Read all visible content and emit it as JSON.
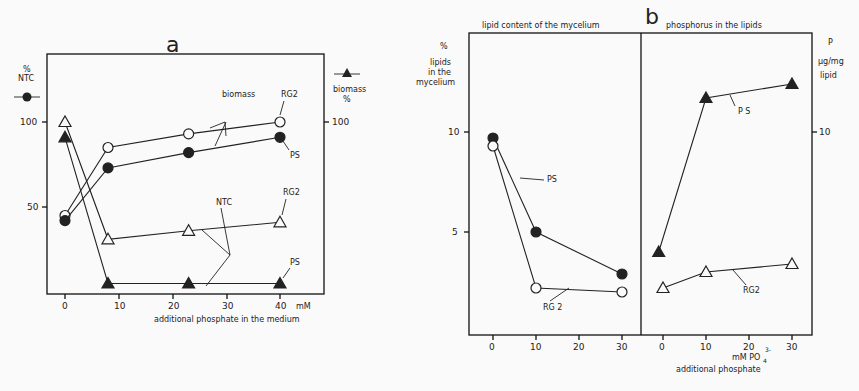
{
  "figure": {
    "panel_a_label": "a",
    "panel_b_label": "b"
  },
  "chart_data": [
    {
      "type": "line",
      "panel": "a",
      "title": "a",
      "xlabel": "additional phosphate in the medium",
      "x_unit": "mM",
      "ylabel_left": "% NTC",
      "ylabel_left_marker": "-●-",
      "ylabel_right": "biomass %",
      "ylabel_right_marker": "-▲-",
      "x_ticks": [
        0,
        10,
        20,
        30,
        40
      ],
      "y_ticks_left": [
        50,
        100
      ],
      "y_ticks_right": [
        100
      ],
      "xlim": [
        -2,
        46
      ],
      "ylim": [
        0,
        125
      ],
      "grid": false,
      "annotations": [
        "biomass",
        "NTC",
        "RG2",
        "PS",
        "RG2",
        "PS"
      ],
      "series": [
        {
          "name": "RG2 NTC",
          "marker": "open-circle",
          "x": [
            0,
            8,
            23,
            40
          ],
          "y": [
            45,
            85,
            93,
            100
          ]
        },
        {
          "name": "PS NTC",
          "marker": "filled-circle",
          "x": [
            0,
            8,
            23,
            40
          ],
          "y": [
            42,
            73,
            82,
            91
          ]
        },
        {
          "name": "RG2 biomass",
          "marker": "open-triangle",
          "x": [
            0,
            8,
            23,
            40
          ],
          "y": [
            100,
            31,
            36,
            41
          ]
        },
        {
          "name": "PS biomass",
          "marker": "filled-triangle",
          "x": [
            0,
            8,
            23,
            40
          ],
          "y": [
            91,
            5,
            5,
            5
          ]
        }
      ]
    },
    {
      "type": "line",
      "panel": "b-left",
      "title": "lipid content of the mycelium",
      "xlabel": "",
      "ylabel": "% lipids in the mycelium",
      "x_ticks": [
        0,
        10,
        20,
        30
      ],
      "y_ticks": [
        5,
        10
      ],
      "xlim": [
        -5,
        35
      ],
      "ylim": [
        0,
        15
      ],
      "grid": false,
      "series": [
        {
          "name": "PS",
          "marker": "filled-circle",
          "x": [
            0,
            10,
            30
          ],
          "y": [
            9.7,
            5.0,
            2.9
          ]
        },
        {
          "name": "RG 2",
          "marker": "open-circle",
          "x": [
            0,
            10,
            30
          ],
          "y": [
            9.3,
            2.2,
            2.0
          ]
        }
      ]
    },
    {
      "type": "line",
      "panel": "b-right",
      "title": "phosphorus in the lipids",
      "xlabel": "mM PO4 3- additional phosphate",
      "ylabel": "P µg/mg lipid",
      "x_ticks": [
        0,
        10,
        20,
        30
      ],
      "y_ticks": [
        10
      ],
      "xlim": [
        -5,
        35
      ],
      "ylim": [
        0,
        15
      ],
      "grid": false,
      "series": [
        {
          "name": "PS",
          "marker": "filled-triangle",
          "x": [
            -1,
            10,
            30
          ],
          "y": [
            4.0,
            11.7,
            12.4
          ]
        },
        {
          "name": "RG2",
          "marker": "open-triangle",
          "x": [
            0,
            10,
            30
          ],
          "y": [
            2.2,
            3.0,
            3.4
          ]
        }
      ]
    }
  ],
  "labels": {
    "a_left_unit": "%",
    "a_left_name": "NTC",
    "a_right_name": "biomass",
    "a_right_unit": "%",
    "a_x_unit": "mM",
    "a_xlabel": "additional phosphate in the medium",
    "a_biomass": "biomass",
    "a_ntc": "NTC",
    "a_rg2_top": "RG2",
    "a_ps_top": "PS",
    "a_rg2_mid": "RG2",
    "a_ps_bot": "PS",
    "a_tick_100": "100",
    "a_tick_50": "50",
    "a_rtick_100": "100",
    "a_xticks": [
      "0",
      "10",
      "20",
      "30",
      "40"
    ],
    "b_left_title": "lipid content of the mycelium",
    "b_right_title": "phosphorus in the lipids",
    "b_left_unit": "%",
    "b_left_y1": "lipids",
    "b_left_y2": "in the",
    "b_left_y3": "mycelium",
    "b_right_y1": "P",
    "b_right_y2": "µg/mg",
    "b_right_y3": "lipid",
    "b_tick_10": "10",
    "b_tick_5": "5",
    "b_rtick_10": "10",
    "b_xticks": [
      "0",
      "10",
      "20",
      "30"
    ],
    "b_ps_left": "PS",
    "b_rg2_left": "RG 2",
    "b_ps_right": "P S",
    "b_rg2_right": "RG2",
    "b_xunit": "mM PO",
    "b_xunit_sub": "4",
    "b_xunit_sup": "3-",
    "b_xlabel": "additional phosphate"
  }
}
